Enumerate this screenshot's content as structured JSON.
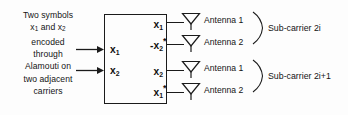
{
  "diagram": {
    "caption": {
      "lines": [
        "Two symbols",
        "x1 and x2",
        "encoded",
        "through",
        "Alamouti on",
        "two adjacent",
        "carriers"
      ],
      "line1": "Two symbols",
      "line2_pre": "x",
      "line2_sub1": "1",
      "line2_mid": " and x",
      "line2_sub2": "2",
      "line3": "encoded",
      "line4": "through",
      "line5": "Alamouti on",
      "line6": "two adjacent",
      "line7": "carriers"
    },
    "encoder": {
      "inputs": [
        {
          "base": "x",
          "sub": "1",
          "conjugate": false,
          "negated": false
        },
        {
          "base": "x",
          "sub": "2",
          "conjugate": false,
          "negated": false
        }
      ],
      "outputs": [
        {
          "base": "x",
          "sub": "1",
          "conjugate": false,
          "negated": false,
          "sign": "",
          "star": ""
        },
        {
          "base": "x",
          "sub": "2",
          "conjugate": true,
          "negated": true,
          "sign": "-",
          "star": "*"
        },
        {
          "base": "x",
          "sub": "2",
          "conjugate": false,
          "negated": false,
          "sign": "",
          "star": ""
        },
        {
          "base": "x",
          "sub": "1",
          "conjugate": true,
          "negated": false,
          "sign": "",
          "star": "*"
        }
      ]
    },
    "antennas": [
      {
        "label": "Antenna 1",
        "icon": "antenna-icon"
      },
      {
        "label": "Antenna 2",
        "icon": "antenna-icon"
      },
      {
        "label": "Antenna 1",
        "icon": "antenna-icon"
      },
      {
        "label": "Antenna 2",
        "icon": "antenna-icon"
      }
    ],
    "groups": [
      {
        "label": "Sub-carrier 2i"
      },
      {
        "label": "Sub-carrier 2i+1"
      }
    ],
    "colors": {
      "stroke": "#1b1b1b",
      "text": "#141414",
      "background": "#fdfdfd"
    }
  }
}
